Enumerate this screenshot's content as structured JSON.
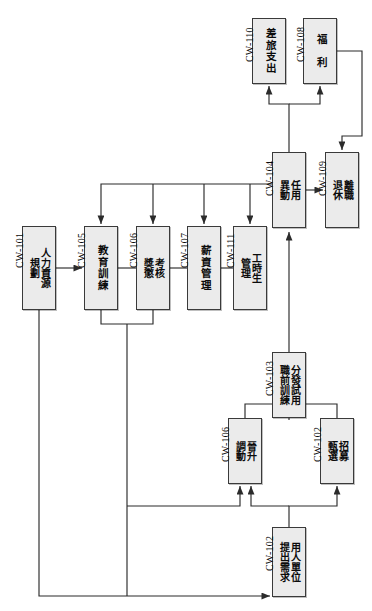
{
  "diagram": {
    "orientation": "rotated-90",
    "box_fill": "#ebebeb",
    "box_stroke": "#3a3a3a",
    "line_color": "#2b2b2b",
    "nodes": [
      {
        "id": "CW-101",
        "label": "人力資源\n規劃",
        "x": 22,
        "y": 226,
        "w": 34,
        "h": 84
      },
      {
        "id": "CW-105",
        "label": "教育訓練",
        "x": 84,
        "y": 226,
        "w": 34,
        "h": 84
      },
      {
        "id": "CW-106a",
        "label": "考核\n獎懲",
        "x": 136,
        "y": 226,
        "w": 34,
        "h": 84
      },
      {
        "id": "CW-107",
        "label": "薪資管理",
        "x": 187,
        "y": 226,
        "w": 34,
        "h": 84
      },
      {
        "id": "CW-111",
        "label": "工時生\n管理",
        "x": 233,
        "y": 226,
        "w": 34,
        "h": 84
      },
      {
        "id": "CW-104",
        "label": "任用\n異動",
        "x": 272,
        "y": 152,
        "w": 34,
        "h": 76
      },
      {
        "id": "CW-109",
        "label": "離職\n退休",
        "x": 325,
        "y": 152,
        "w": 34,
        "h": 76
      },
      {
        "id": "CW-110",
        "label": "差旅支出",
        "x": 252,
        "y": 18,
        "w": 34,
        "h": 66
      },
      {
        "id": "CW-108",
        "label": "福  利",
        "x": 303,
        "y": 18,
        "w": 34,
        "h": 66
      },
      {
        "id": "CW-103",
        "label": "分發試用\n職前訓練",
        "x": 272,
        "y": 352,
        "w": 34,
        "h": 66
      },
      {
        "id": "CW-106b",
        "label": "晉升\n調動",
        "x": 228,
        "y": 418,
        "w": 34,
        "h": 66
      },
      {
        "id": "CW-102a",
        "label": "招募\n甄選",
        "x": 320,
        "y": 418,
        "w": 34,
        "h": 66
      },
      {
        "id": "CW-102b",
        "label": "用人單位\n提出需求",
        "x": 272,
        "y": 527,
        "w": 34,
        "h": 70
      }
    ],
    "id_labels": [
      {
        "text": "CW-101",
        "x": 14,
        "y": 268
      },
      {
        "text": "CW-105",
        "x": 76,
        "y": 268
      },
      {
        "text": "CW-106",
        "x": 128,
        "y": 268
      },
      {
        "text": "CW-107",
        "x": 179,
        "y": 268
      },
      {
        "text": "CW-111",
        "x": 225,
        "y": 268
      },
      {
        "text": "CW-104",
        "x": 264,
        "y": 196
      },
      {
        "text": "CW-109",
        "x": 317,
        "y": 196
      },
      {
        "text": "CW-110",
        "x": 244,
        "y": 62
      },
      {
        "text": "CW-108",
        "x": 295,
        "y": 62
      },
      {
        "text": "CW-103",
        "x": 264,
        "y": 396
      },
      {
        "text": "CW-106",
        "x": 220,
        "y": 462
      },
      {
        "text": "CW-102",
        "x": 312,
        "y": 462
      },
      {
        "text": "CW-102",
        "x": 264,
        "y": 571
      }
    ]
  }
}
